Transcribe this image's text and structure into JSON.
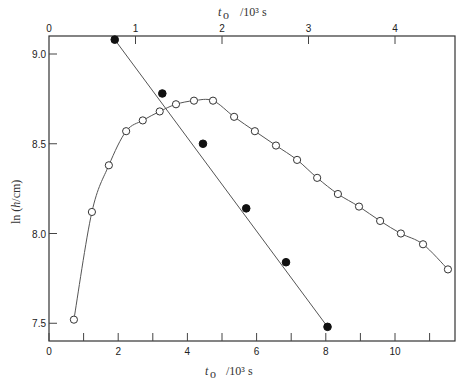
{
  "chart_data": {
    "type": "scatter",
    "title": "",
    "xlabel": "t_o /10^3 s",
    "xlabel_top": "t_o /10^3 s",
    "ylabel": "ln (h/cm)",
    "xlim": [
      0,
      11.7
    ],
    "xlim_top": [
      0,
      4.68
    ],
    "ylim": [
      7.41,
      9.1
    ],
    "grid": false,
    "legend": null,
    "x_ticks": [
      0,
      2,
      4,
      6,
      8,
      10
    ],
    "x_minor_ticks": [
      1,
      3,
      5,
      7,
      9,
      11
    ],
    "x_tick_labels": [
      "0",
      "2",
      "4",
      "6",
      "8",
      "10"
    ],
    "x_top_ticks": [
      0,
      1,
      2,
      3,
      4
    ],
    "x_top_tick_labels": [
      "0",
      "1",
      "2",
      "3",
      "4"
    ],
    "y_ticks": [
      7.5,
      8.0,
      8.5,
      9.0
    ],
    "y_tick_labels": [
      "7.5",
      "8.0",
      "8.5",
      "9.0"
    ],
    "series": [
      {
        "name": "open circles (bottom axis)",
        "marker": "open-circle",
        "axis": "bottom",
        "line": "smooth curve",
        "x": [
          0.72,
          1.24,
          1.73,
          2.23,
          2.71,
          3.2,
          3.67,
          4.19,
          4.74,
          5.35,
          5.95,
          6.56,
          7.17,
          7.75,
          8.35,
          8.96,
          9.57,
          10.17,
          10.81,
          11.53
        ],
        "y": [
          7.52,
          8.12,
          8.38,
          8.57,
          8.63,
          8.68,
          8.72,
          8.74,
          8.74,
          8.65,
          8.57,
          8.49,
          8.41,
          8.31,
          8.22,
          8.15,
          8.07,
          8.0,
          7.94,
          7.8
        ]
      },
      {
        "name": "filled circles (top axis)",
        "marker": "filled-circle",
        "axis": "top",
        "line": "straight fit",
        "x": [
          0.76,
          1.31,
          1.78,
          2.28,
          2.74,
          3.22
        ],
        "x_bottom_equiv": [
          1.91,
          3.27,
          4.45,
          5.69,
          6.85,
          8.06
        ],
        "y": [
          9.08,
          8.78,
          8.5,
          8.14,
          7.84,
          7.48
        ]
      }
    ]
  }
}
